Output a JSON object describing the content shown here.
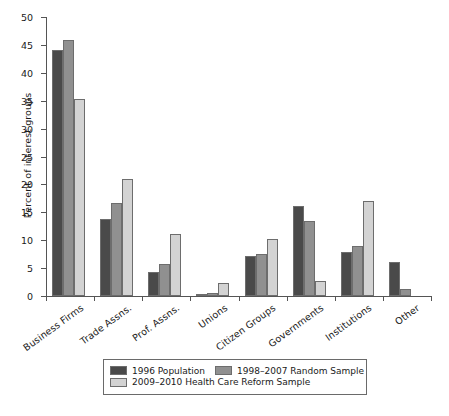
{
  "chart_data": {
    "type": "bar",
    "title": "",
    "xlabel": "",
    "ylabel": "Percent of interest groups",
    "ylim": [
      0,
      50
    ],
    "ytick_step": 5,
    "yticks": [
      "0",
      "5",
      "10",
      "15",
      "20",
      "25",
      "30",
      "35",
      "40",
      "45",
      "50"
    ],
    "grid": false,
    "legend_position": "bottom",
    "categories": [
      "Business Firms",
      "Trade Assns.",
      "Prof. Assns.",
      "Unions",
      "Citizen Groups",
      "Governments",
      "Institutions",
      "Other"
    ],
    "series": [
      {
        "name": "1996 Population",
        "color": "#4a4a4a",
        "values": [
          44.0,
          13.8,
          4.3,
          0.4,
          7.2,
          16.2,
          7.9,
          6.1
        ]
      },
      {
        "name": "1998–2007 Random Sample",
        "color": "#909090",
        "values": [
          45.8,
          16.6,
          5.7,
          0.6,
          7.5,
          13.4,
          9.0,
          1.2
        ]
      },
      {
        "name": "2009–2010 Health Care Reform Sample",
        "color": "#d3d3d3",
        "values": [
          35.3,
          20.9,
          11.2,
          2.4,
          10.2,
          2.7,
          17.1,
          0.0
        ]
      }
    ]
  },
  "legend": {
    "rows": [
      [
        {
          "label": "1996 Population",
          "color": "#4a4a4a"
        },
        {
          "label": "1998–2007 Random Sample",
          "color": "#909090"
        }
      ],
      [
        {
          "label": "2009–2010 Health Care Reform Sample",
          "color": "#d3d3d3"
        }
      ]
    ]
  }
}
